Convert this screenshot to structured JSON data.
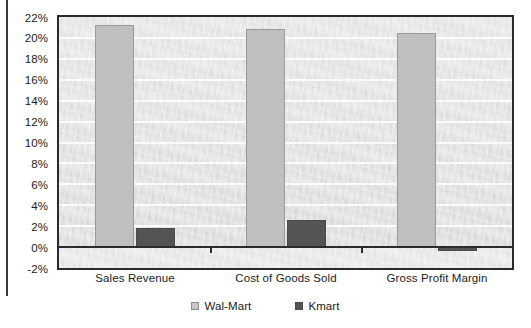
{
  "chart_data": {
    "type": "bar",
    "title": "",
    "subtitle": "",
    "xlabel": "",
    "ylabel": "",
    "categories": [
      "Sales Revenue",
      "Cost of Goods Sold",
      "Gross Profit Margin"
    ],
    "series": [
      {
        "name": "Wal-Mart",
        "color": "#bfbfbf",
        "values": [
          21.2,
          20.9,
          20.5
        ]
      },
      {
        "name": "Kmart",
        "color": "#545454",
        "values": [
          1.8,
          2.6,
          -0.4
        ]
      }
    ],
    "ylim": [
      -2,
      22
    ],
    "ytick_values": [
      22,
      20,
      18,
      16,
      14,
      12,
      10,
      8,
      6,
      4,
      2,
      0,
      -2
    ],
    "ytick_labels": [
      "22%",
      "20%",
      "18%",
      "16%",
      "14%",
      "12%",
      "10%",
      "8%",
      "6%",
      "4%",
      "2%",
      "0%",
      "-2%"
    ],
    "grid": true,
    "gridline_color": "#fbfbfb",
    "zero_line": true,
    "legend_position": "bottom",
    "plot_background": "#d7d7d7",
    "frame_color": "#2b2b2b",
    "units": "percent"
  }
}
